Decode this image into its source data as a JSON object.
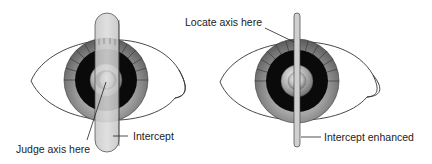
{
  "figure": {
    "left_panel": {
      "labels": {
        "judge_axis": "Judge axis here",
        "intercept": "Intercept"
      }
    },
    "right_panel": {
      "labels": {
        "locate_axis": "Locate axis here",
        "intercept_enhanced": "Intercept enhanced"
      }
    }
  },
  "colors": {
    "outline": "#333333",
    "iris_outer": "#8a8a8a",
    "iris_dark": "#0a0a0a",
    "pupil_ring": "#9a9a9a",
    "strip": "#d0d0d0"
  }
}
